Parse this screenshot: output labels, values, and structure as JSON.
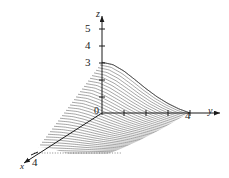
{
  "figure": {
    "background": "#ffffff",
    "ink": "#1a1a1a",
    "mesh_color": "#555555"
  },
  "axes": {
    "z": {
      "label": "z",
      "ticks": [
        "3",
        "4",
        "5"
      ],
      "tick_5": "5",
      "tick_4": "4",
      "tick_3": "3"
    },
    "y": {
      "label": "y",
      "tick_4": "4"
    },
    "x": {
      "label": "x",
      "tick_4": "4"
    },
    "origin": {
      "label": "0"
    }
  },
  "chart_data": {
    "type": "line",
    "title": "",
    "subtitle": "",
    "xlabel": "x",
    "ylabel": "y",
    "zlabel": "z",
    "projection": "3d-surface",
    "render_style": "hatched-ruled-surface",
    "grid": false,
    "legend": null,
    "xlim": [
      0,
      4
    ],
    "ylim": [
      0,
      4
    ],
    "zlim": [
      0,
      5
    ],
    "xticks": [
      4
    ],
    "yticks": [
      4
    ],
    "zticks": [
      3,
      4,
      5
    ],
    "xtick_labels": [
      "4"
    ],
    "ytick_labels": [
      "4"
    ],
    "ztick_labels": [
      "3",
      "4",
      "5"
    ],
    "surface_peak_z": 3,
    "surface_peak_at": [
      0,
      0
    ],
    "surface_zero_edge_y": 4,
    "domain_description": "0 <= x <= 4, 0 <= y <= 4",
    "annotations": [],
    "series": [
      {
        "name": "surface z = f(x,y)",
        "description": "Ruled surface drawn as a family of constant-x curves; height 3 along the z-axis at the origin edge, decaying to 0 at y = 4 and sloping down along x to x = 4.",
        "x": [
          0,
          0.5,
          1,
          1.5,
          2,
          2.5,
          3,
          3.5,
          4
        ],
        "y": [
          0,
          0.5,
          1,
          1.5,
          2,
          2.5,
          3,
          3.5,
          4
        ],
        "z_rows": [
          [
            3.0,
            2.86,
            2.48,
            1.97,
            1.44,
            0.96,
            0.56,
            0.24,
            0.0
          ],
          [
            2.63,
            2.5,
            2.17,
            1.72,
            1.26,
            0.84,
            0.49,
            0.21,
            0.0
          ],
          [
            2.25,
            2.14,
            1.86,
            1.48,
            1.08,
            0.72,
            0.42,
            0.18,
            0.0
          ],
          [
            1.88,
            1.79,
            1.55,
            1.23,
            0.9,
            0.6,
            0.35,
            0.15,
            0.0
          ],
          [
            1.5,
            1.43,
            1.24,
            0.98,
            0.72,
            0.48,
            0.28,
            0.12,
            0.0
          ],
          [
            1.13,
            1.07,
            0.93,
            0.74,
            0.54,
            0.36,
            0.21,
            0.09,
            0.0
          ],
          [
            0.75,
            0.71,
            0.62,
            0.49,
            0.36,
            0.24,
            0.14,
            0.06,
            0.0
          ],
          [
            0.38,
            0.36,
            0.31,
            0.25,
            0.18,
            0.12,
            0.07,
            0.03,
            0.0
          ],
          [
            0.0,
            0.0,
            0.0,
            0.0,
            0.0,
            0.0,
            0.0,
            0.0,
            0.0
          ]
        ]
      }
    ]
  }
}
